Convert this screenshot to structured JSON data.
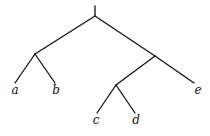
{
  "diagram": {
    "type": "tree",
    "root": "r",
    "nodes": [
      {
        "id": "r",
        "label": ""
      },
      {
        "id": "n1",
        "label": ""
      },
      {
        "id": "n2",
        "label": ""
      },
      {
        "id": "n3",
        "label": ""
      },
      {
        "id": "a",
        "label": "a"
      },
      {
        "id": "b",
        "label": "b"
      },
      {
        "id": "c",
        "label": "c"
      },
      {
        "id": "d",
        "label": "d"
      },
      {
        "id": "e",
        "label": "e"
      }
    ],
    "edges": [
      {
        "from": "r",
        "to": "n1"
      },
      {
        "from": "r",
        "to": "n2"
      },
      {
        "from": "n1",
        "to": "a"
      },
      {
        "from": "n1",
        "to": "b"
      },
      {
        "from": "n2",
        "to": "n3"
      },
      {
        "from": "n2",
        "to": "e"
      },
      {
        "from": "n3",
        "to": "c"
      },
      {
        "from": "n3",
        "to": "d"
      }
    ],
    "labels": {
      "a": "a",
      "b": "b",
      "c": "c",
      "d": "d",
      "e": "e"
    },
    "colors": {
      "line": "#111111",
      "background": "#ffffff"
    }
  }
}
